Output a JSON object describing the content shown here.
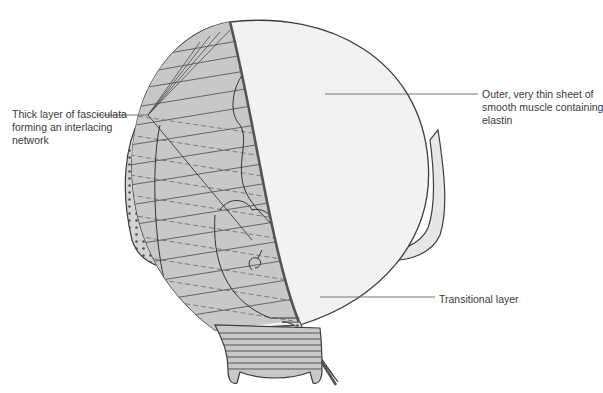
{
  "diagram": {
    "type": "anatomical illustration",
    "colors": {
      "outer_sheet": "#f2f2f2",
      "fasciculata_layer": "#c8c8c8",
      "outline": "#3c3c3c",
      "leader_line": "#666666",
      "label_text": "#3a3a3a"
    }
  },
  "labels": {
    "left": {
      "lines": [
        "Thick layer of fasciculata",
        "forming an interlacing",
        "network"
      ]
    },
    "right": {
      "lines": [
        "Outer, very thin sheet of",
        "smooth muscle containing",
        "elastin"
      ]
    },
    "bottom": {
      "lines": [
        "Transitional layer"
      ]
    }
  }
}
